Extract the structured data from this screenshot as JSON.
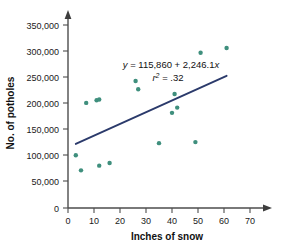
{
  "chart_data": {
    "type": "scatter",
    "title": "",
    "xlabel": "Inches of snow",
    "ylabel": "No. of potholes",
    "xlim": [
      0,
      75
    ],
    "ylim": [
      0,
      365000
    ],
    "xticks": [
      0,
      10,
      20,
      30,
      40,
      50,
      60,
      70
    ],
    "xtick_labels": [
      "0",
      "10",
      "20",
      "30",
      "40",
      "50",
      "60",
      "70"
    ],
    "yticks": [
      0,
      50000,
      100000,
      150000,
      200000,
      250000,
      300000,
      350000
    ],
    "ytick_labels": [
      "0",
      "50,000",
      "100,000",
      "150,000",
      "200,000",
      "250,000",
      "300,000",
      "350,000"
    ],
    "grid": false,
    "legend": null,
    "marker_color": "#3f8f7d",
    "trendline_color": "#2b3a6b",
    "points": [
      {
        "x": 3,
        "y": 101000
      },
      {
        "x": 5,
        "y": 72000
      },
      {
        "x": 7,
        "y": 201000
      },
      {
        "x": 11,
        "y": 206000
      },
      {
        "x": 12,
        "y": 207500
      },
      {
        "x": 12,
        "y": 81000
      },
      {
        "x": 16,
        "y": 86000
      },
      {
        "x": 26,
        "y": 243000
      },
      {
        "x": 27,
        "y": 227000
      },
      {
        "x": 35,
        "y": 124000
      },
      {
        "x": 40,
        "y": 182000
      },
      {
        "x": 41,
        "y": 218000
      },
      {
        "x": 42,
        "y": 192000
      },
      {
        "x": 49,
        "y": 126000
      },
      {
        "x": 51,
        "y": 297000
      },
      {
        "x": 61,
        "y": 306000
      }
    ],
    "trendline": {
      "intercept": 115860,
      "slope": 2246.1,
      "x_start": 3,
      "x_end": 61
    },
    "annotations": {
      "equation": "y = 115,860 + 2,246.1x",
      "equation_lhs": "y",
      "equation_rhs": " = 115,860 + 2,246.1",
      "equation_var": "x",
      "r_squared_symbol": "r",
      "r_squared_exponent": "2",
      "r_squared_value": " = .32",
      "r_squared_full": "r2 = .32"
    }
  }
}
